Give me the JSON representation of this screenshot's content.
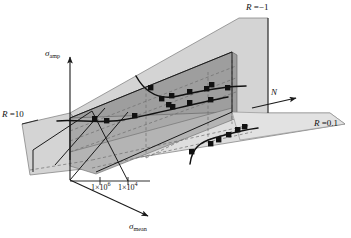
{
  "figure": {
    "background_color": "#ffffff",
    "line_color": "#1a1a1a",
    "marker_color": "#111111",
    "plane_light_color": "#d0d0d0",
    "plane_mid_color": "#bdbdbd",
    "plane_dark_color": "#9a9a9a",
    "dashed_color": "#6e6e6e"
  },
  "axes": {
    "vertical": {
      "name": "sigma-amp-axis",
      "label_html": "<i>&sigma;</i><sub>amp</sub>",
      "label_text": "σamp"
    },
    "depth": {
      "name": "sigma-mean-axis",
      "label_html": "<i>&sigma;</i><sub>mean</sub>",
      "label_text": "σmean"
    },
    "horizontal": {
      "name": "cycles-axis",
      "label_html": "<i>N</i>",
      "label_text": "N"
    }
  },
  "ticks": [
    {
      "name": "tick-1e6",
      "label_html": "1&times;10<sup>6</sup>",
      "label_text": "1×10⁶",
      "value": 1000000
    },
    {
      "name": "tick-1e4",
      "label_html": "1&times;10<sup>4</sup>",
      "label_text": "1×10⁴",
      "value": 10000
    }
  ],
  "planes": [
    {
      "name": "plane-R-neg1",
      "label_html": "<i>R</i> =&minus;1",
      "label_text": "R =−1",
      "stress_ratio": -1,
      "shade": "#d6d6d6"
    },
    {
      "name": "plane-R-10",
      "label_html": "<i>R</i> =10",
      "label_text": "R =10",
      "stress_ratio": 10,
      "shade": "#c6c6c6"
    },
    {
      "name": "plane-R-01",
      "label_html": "<i>R</i> =0.1",
      "label_text": "R =0.1",
      "stress_ratio": 0.1,
      "shade": "#dcdcdc"
    }
  ],
  "chart_data": {
    "type": "scatter",
    "xlabel": "N",
    "ylabel": "σamp",
    "zlabel": "σmean",
    "grid": false,
    "legend": false,
    "xtick_labels": [
      "1×10⁶",
      "1×10⁴"
    ],
    "series": [
      {
        "name": "R = -1",
        "stress_ratio": -1,
        "marker": "square",
        "curve": "fitted S-N curve",
        "points_px": [
          [
            151,
            88
          ],
          [
            162,
            99
          ],
          [
            172,
            96
          ],
          [
            190,
            92
          ],
          [
            207,
            89
          ],
          [
            212,
            85
          ],
          [
            228,
            88
          ]
        ]
      },
      {
        "name": "R = 10",
        "stress_ratio": 10,
        "marker": "square",
        "curve": "fitted S-N curve",
        "points_px": [
          [
            95,
            119
          ],
          [
            107,
            121
          ],
          [
            135,
            116
          ],
          [
            169,
            105
          ],
          [
            173,
            107
          ],
          [
            190,
            103
          ],
          [
            211,
            100
          ]
        ]
      },
      {
        "name": "R = 0.1",
        "stress_ratio": 0.1,
        "marker": "square",
        "curve": "fitted S-N curve",
        "points_px": [
          [
            192,
            152
          ],
          [
            211,
            144
          ],
          [
            219,
            140
          ],
          [
            229,
            135
          ],
          [
            238,
            130
          ],
          [
            245,
            127
          ]
        ]
      }
    ]
  }
}
